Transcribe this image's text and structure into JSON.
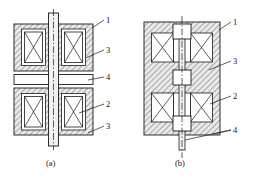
{
  "figure": {
    "background": "#ffffff",
    "line_color": "#1a1a1a",
    "hatch_color": "#3a3a3a",
    "coil_fill": "#ffffff",
    "body_fill": "#e8e8e8"
  },
  "subfigures": [
    {
      "id": "a",
      "caption": "(a)",
      "description": "Symmetric double-ended solenoid with central armature disc",
      "labels": [
        {
          "key": "1",
          "text": "1",
          "x": 108,
          "y": 21,
          "target_x": 92,
          "target_y": 28
        },
        {
          "key": "3",
          "text": "3",
          "x": 108,
          "y": 51,
          "target_x": 86,
          "target_y": 58
        },
        {
          "key": "4",
          "text": "4",
          "x": 108,
          "y": 79,
          "target_x": 88,
          "target_y": 82
        },
        {
          "key": "2",
          "text": "2",
          "x": 108,
          "y": 106,
          "target_x": 80,
          "target_y": 113
        },
        {
          "key": "3b",
          "text": "3",
          "x": 108,
          "y": 128,
          "target_x": 88,
          "target_y": 134
        }
      ]
    },
    {
      "id": "b",
      "caption": "(b)",
      "description": "Stacked multi-gap solenoid with three armature blocks on a common shaft",
      "labels": [
        {
          "key": "1",
          "text": "1",
          "x": 235,
          "y": 23,
          "target_x": 219,
          "target_y": 30
        },
        {
          "key": "3",
          "text": "3",
          "x": 235,
          "y": 62,
          "target_x": 210,
          "target_y": 70
        },
        {
          "key": "2",
          "text": "2",
          "x": 235,
          "y": 97,
          "target_x": 211,
          "target_y": 104
        },
        {
          "key": "4",
          "text": "4",
          "x": 235,
          "y": 131,
          "target_x": 186,
          "target_y": 146
        }
      ]
    }
  ],
  "legend_keys": {
    "1": "housing / yoke outer shell",
    "2": "core body",
    "3": "coil winding",
    "4": "armature / shaft plate"
  }
}
